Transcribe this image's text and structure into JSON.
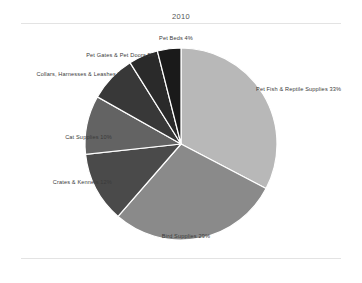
{
  "chart_title": "2010",
  "chart_data": {
    "type": "pie",
    "title": "2010",
    "xlabel": "",
    "ylabel": "",
    "legend_position": "none",
    "grid": false,
    "start_angle_deg": 0,
    "direction": "clockwise",
    "categories": [
      "Pet Fish & Reptile Supplies",
      "Bird Supplies",
      "Crates & Kennels",
      "Cat Supplies",
      "Collars, Harnesses & Leashes",
      "Pet Gates & Pet Doors",
      "Pet Beds"
    ],
    "values": [
      33,
      29,
      12,
      10,
      8,
      5,
      4
    ],
    "value_unit": "%",
    "colors": [
      "#b8b8b8",
      "#8a8a8a",
      "#4a4a4a",
      "#636363",
      "#383838",
      "#2a2a2a",
      "#1a1a1a"
    ],
    "slice_divider_color": "#ffffff",
    "labels": [
      "Pet Fish & Reptile Supplies 33%",
      "Bird Supplies 29%",
      "Crates & Kennels 12%",
      "Cat Supplies 10%",
      "Collars, Harnesses & Leashes 8%",
      "Pet Gates & Pet Doors 5%",
      "Pet Beds 4%"
    ],
    "slices": [
      {
        "label": "Pet Fish & Reptile Supplies 33%",
        "name": "Pet Fish & Reptile Supplies",
        "value": 33,
        "color": "#b8b8b8"
      },
      {
        "label": "Bird Supplies 29%",
        "name": "Bird Supplies",
        "value": 29,
        "color": "#8a8a8a"
      },
      {
        "label": "Crates & Kennels 12%",
        "name": "Crates & Kennels",
        "value": 12,
        "color": "#4a4a4a"
      },
      {
        "label": "Cat Supplies 10%",
        "name": "Cat Supplies",
        "value": 10,
        "color": "#636363"
      },
      {
        "label": "Collars, Harnesses & Leashes 8%",
        "name": "Collars, Harnesses & Leashes",
        "value": 8,
        "color": "#383838"
      },
      {
        "label": "Pet Gates & Pet Doors 5%",
        "name": "Pet Gates & Pet Doors",
        "value": 5,
        "color": "#2a2a2a"
      },
      {
        "label": "Pet Beds 4%",
        "name": "Pet Beds",
        "value": 4,
        "color": "#1a1a1a"
      }
    ]
  }
}
